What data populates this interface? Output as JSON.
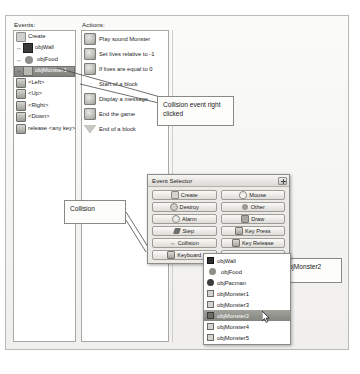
{
  "panel": {
    "events_header": "Events:",
    "actions_header": "Actions:",
    "events": [
      {
        "label": "Create",
        "icon": "create-icon",
        "collision": false,
        "selected": false
      },
      {
        "label": "objWall",
        "icon": "wall-icon",
        "collision": true,
        "selected": false
      },
      {
        "label": "objFood",
        "icon": "food-icon",
        "collision": true,
        "selected": false
      },
      {
        "label": "objMonster1",
        "icon": "monster-icon",
        "collision": true,
        "selected": true
      },
      {
        "label": "<Left>",
        "icon": "key-icon",
        "collision": false,
        "selected": false
      },
      {
        "label": "<Up>",
        "icon": "key-icon",
        "collision": false,
        "selected": false
      },
      {
        "label": "<Right>",
        "icon": "key-icon",
        "collision": false,
        "selected": false
      },
      {
        "label": "<Down>",
        "icon": "key-icon",
        "collision": false,
        "selected": false
      },
      {
        "label": "release <any key>",
        "icon": "key-icon",
        "collision": false,
        "selected": false
      }
    ],
    "actions": [
      {
        "label": "Play sound Monster",
        "icon": "sound-action-icon",
        "kind": "icon"
      },
      {
        "label": "Set lives relative to -1",
        "icon": "lives-action-icon",
        "kind": "icon"
      },
      {
        "label": "If lives are equal to 0",
        "icon": "question-action-icon",
        "kind": "icon"
      },
      {
        "label": "Start of a block",
        "icon": "block-start-icon",
        "kind": "none"
      },
      {
        "label": "Display a message",
        "icon": "message-action-icon",
        "kind": "icon"
      },
      {
        "label": "End the game",
        "icon": "endgame-action-icon",
        "kind": "icon"
      },
      {
        "label": "End of a block",
        "icon": "block-end-icon",
        "kind": "triangle"
      }
    ]
  },
  "event_selector": {
    "title": "Event Selector",
    "close_label": "",
    "buttons": [
      {
        "label": "Create",
        "icon": "create-icon"
      },
      {
        "label": "Mouse",
        "icon": "mouse-icon"
      },
      {
        "label": "Destroy",
        "icon": "destroy-icon"
      },
      {
        "label": "Other",
        "icon": "other-icon"
      },
      {
        "label": "Alarm",
        "icon": "alarm-icon"
      },
      {
        "label": "Draw",
        "icon": "draw-icon"
      },
      {
        "label": "Step",
        "icon": "step-icon"
      },
      {
        "label": "Key Press",
        "icon": "keypress-icon"
      },
      {
        "label": "Collision",
        "icon": "collision-icon"
      },
      {
        "label": "Key Release",
        "icon": "keyrelease-icon"
      },
      {
        "label": "Keyboard",
        "icon": "keyboard-icon"
      },
      {
        "label": "",
        "icon": "blank-icon"
      }
    ]
  },
  "object_list": {
    "items": [
      {
        "label": "objWall",
        "icon": "wall-icon",
        "selected": false
      },
      {
        "label": "objFood",
        "icon": "food-icon",
        "selected": false
      },
      {
        "label": "objPacman",
        "icon": "pacman-icon",
        "selected": false
      },
      {
        "label": "objMonster1",
        "icon": "monster-icon",
        "selected": false
      },
      {
        "label": "objMonster3",
        "icon": "monster-icon",
        "selected": false
      },
      {
        "label": "objMonster2",
        "icon": "monster-icon",
        "selected": true
      },
      {
        "label": "objMonster4",
        "icon": "monster-icon",
        "selected": false
      },
      {
        "label": "objMonster5",
        "icon": "monster-icon",
        "selected": false
      }
    ]
  },
  "callouts": {
    "collision_event": "Collision event right clicked",
    "collision": "Collision",
    "objmonster2": "objMonster2"
  },
  "colors": {
    "panel_bg": "#f3f3f2",
    "selection": "#85857f",
    "border": "#8d8d88",
    "text": "#1b1b1b"
  }
}
